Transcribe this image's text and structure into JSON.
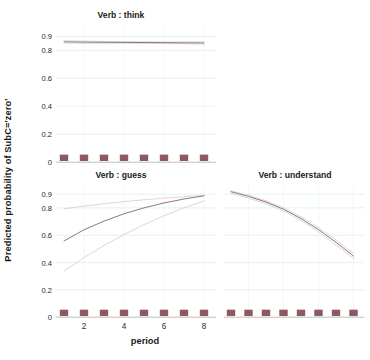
{
  "chart_data": {
    "type": "line",
    "title": "",
    "xlabel": "period",
    "ylabel": "Predicted probability of SubC='zero'",
    "xlim": [
      0.6,
      8.6
    ],
    "ylim": [
      -0.02,
      0.96
    ],
    "xticks": [
      2,
      4,
      6,
      8
    ],
    "xticklabels": [
      "2",
      "4",
      "6",
      "8"
    ],
    "yticks": [
      0,
      0.2,
      0.4,
      0.6,
      0.8,
      0.9
    ],
    "yticklabels": [
      "0",
      "0.2",
      "0.4",
      "0.6",
      "0.8",
      "0.9"
    ],
    "grid": true,
    "grid_color": "#d9ecec",
    "layout": "3 panels: 'think' top-left, 'guess' bottom-left, 'understand' bottom-right",
    "legend": "none",
    "line_color": "#8a7a7d",
    "ci_color": "#d8cdcf",
    "rug_color": "#8d5a61",
    "x": [
      1,
      2,
      3,
      4,
      5,
      6,
      7,
      8
    ],
    "panels": [
      {
        "name": "think",
        "title": "Verb : think",
        "series": [
          {
            "name": "fit",
            "values": [
              0.861,
              0.859,
              0.858,
              0.857,
              0.856,
              0.855,
              0.854,
              0.853
            ]
          },
          {
            "name": "ci_upper",
            "values": [
              0.869,
              0.866,
              0.864,
              0.862,
              0.861,
              0.86,
              0.86,
              0.861
            ]
          },
          {
            "name": "ci_lower",
            "values": [
              0.852,
              0.851,
              0.851,
              0.851,
              0.85,
              0.849,
              0.847,
              0.845
            ]
          }
        ],
        "rug_x": [
          1,
          2,
          3,
          4,
          5,
          6,
          7,
          8
        ]
      },
      {
        "name": "guess",
        "title": "Verb : guess",
        "series": [
          {
            "name": "fit",
            "values": [
              0.558,
              0.64,
              0.703,
              0.757,
              0.8,
              0.836,
              0.865,
              0.888
            ]
          },
          {
            "name": "ci_upper",
            "values": [
              0.793,
              0.813,
              0.83,
              0.846,
              0.859,
              0.871,
              0.881,
              0.893
            ]
          },
          {
            "name": "ci_lower",
            "values": [
              0.337,
              0.436,
              0.525,
              0.605,
              0.678,
              0.742,
              0.8,
              0.851
            ]
          }
        ],
        "rug_x": [
          1,
          2,
          3,
          4,
          5,
          6,
          7,
          8
        ]
      },
      {
        "name": "understand",
        "title": "Verb : understand",
        "series": [
          {
            "name": "fit",
            "values": [
              0.918,
              0.884,
              0.843,
              0.79,
              0.722,
              0.641,
              0.548,
              0.448
            ]
          },
          {
            "name": "ci_upper",
            "values": [
              0.925,
              0.893,
              0.852,
              0.8,
              0.735,
              0.656,
              0.566,
              0.468
            ]
          },
          {
            "name": "ci_lower",
            "values": [
              0.906,
              0.872,
              0.83,
              0.777,
              0.708,
              0.625,
              0.529,
              0.428
            ]
          }
        ],
        "rug_x": [
          1,
          2,
          3,
          4,
          5,
          6,
          7,
          8
        ]
      }
    ]
  }
}
